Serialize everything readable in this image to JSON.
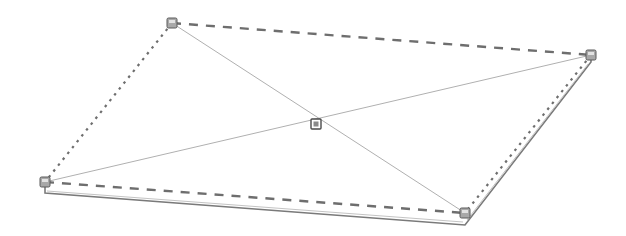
{
  "diagram": {
    "colors": {
      "background": "#ffffff",
      "edge": "#6e6e6e",
      "diagonal": "#b0b0b0",
      "thickness": "#7a7a7a",
      "handle_fill": "#a8a8a8",
      "handle_stroke": "#5a5a5a",
      "handle_inner": "#e2e2e2"
    },
    "corners": {
      "top_left": [
        172,
        23
      ],
      "top_right": [
        591,
        55
      ],
      "bottom_right": [
        465,
        213
      ],
      "bottom_left": [
        45,
        182
      ]
    },
    "center": [
      316,
      124
    ],
    "thickness_px": 11,
    "edges": [
      {
        "name": "top-edge",
        "style": "dashed"
      },
      {
        "name": "right-edge",
        "style": "dotted"
      },
      {
        "name": "bottom-edge",
        "style": "dashed"
      },
      {
        "name": "left-edge",
        "style": "dotted"
      }
    ],
    "handles": [
      "top-left",
      "top-right",
      "bottom-right",
      "bottom-left",
      "center"
    ]
  }
}
